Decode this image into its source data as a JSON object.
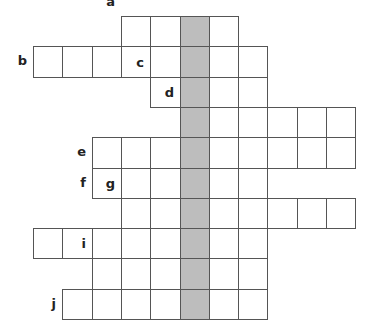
{
  "puzzle": {
    "type": "crossword-puzzle",
    "shaded_column": 5,
    "colors": {
      "grid_line": "#555555",
      "cell": "#ffffff",
      "shaded": "#bdbdbd",
      "label": "#222222"
    },
    "rows": [
      {
        "label": "a",
        "start": 3,
        "end": 6
      },
      {
        "label": "b",
        "start": 0,
        "end": 7
      },
      {
        "label": "c",
        "start": 4,
        "end": 7
      },
      {
        "label": "d",
        "start": 5,
        "end": 10
      },
      {
        "label": "e",
        "start": 2,
        "end": 10
      },
      {
        "label": "f",
        "start": 2,
        "end": 7
      },
      {
        "label": "g",
        "start": 3,
        "end": 10
      },
      {
        "label": "",
        "start": 0,
        "end": 7
      },
      {
        "label": "i",
        "start": 2,
        "end": 7
      },
      {
        "label": "j",
        "start": 1,
        "end": 7
      }
    ]
  }
}
